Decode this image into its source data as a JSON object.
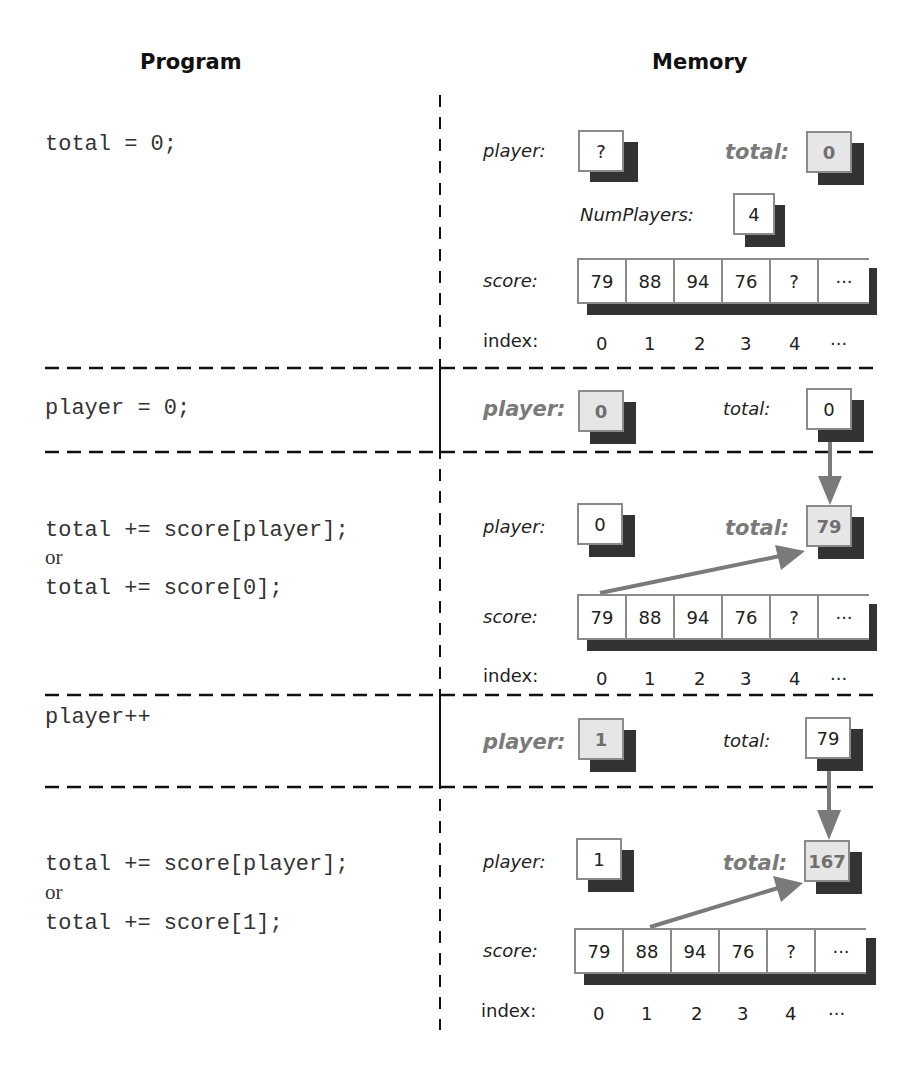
{
  "headers": {
    "program": "Program",
    "memory": "Memory"
  },
  "colors": {
    "arrow": "#7a7a7a",
    "highlight_fill": "#e6e6e6",
    "shadow": "#333333",
    "box_border": "#8a8a8a"
  },
  "steps": [
    {
      "code": [
        "total = 0;"
      ],
      "memory": {
        "player": {
          "label": "player:",
          "value": "?",
          "highlighted": false
        },
        "total": {
          "label": "total:",
          "value": "0",
          "highlighted": true
        },
        "numplayers": {
          "label": "NumPlayers:",
          "value": "4"
        },
        "score": {
          "label": "score:",
          "cells": [
            "79",
            "88",
            "94",
            "76",
            "?",
            "..."
          ]
        },
        "index": {
          "label": "index:",
          "values": [
            "0",
            "1",
            "2",
            "3",
            "4",
            "..."
          ]
        }
      }
    },
    {
      "code": [
        "player = 0;"
      ],
      "memory": {
        "player": {
          "label": "player:",
          "value": "0",
          "highlighted": true
        },
        "total": {
          "label": "total:",
          "value": "0",
          "highlighted": false
        }
      }
    },
    {
      "code": [
        "total += score[player];",
        "or",
        "total += score[0];"
      ],
      "memory": {
        "player": {
          "label": "player:",
          "value": "0",
          "highlighted": false
        },
        "total": {
          "label": "total:",
          "value": "79",
          "highlighted": true
        },
        "score": {
          "label": "score:",
          "cells": [
            "79",
            "88",
            "94",
            "76",
            "?",
            "..."
          ]
        },
        "index": {
          "label": "index:",
          "values": [
            "0",
            "1",
            "2",
            "3",
            "4",
            "..."
          ]
        }
      }
    },
    {
      "code": [
        "player++"
      ],
      "memory": {
        "player": {
          "label": "player:",
          "value": "1",
          "highlighted": true
        },
        "total": {
          "label": "total:",
          "value": "79",
          "highlighted": false
        }
      }
    },
    {
      "code": [
        "total += score[player];",
        "or",
        "total += score[1];"
      ],
      "memory": {
        "player": {
          "label": "player:",
          "value": "1",
          "highlighted": false
        },
        "total": {
          "label": "total:",
          "value": "167",
          "highlighted": true
        },
        "score": {
          "label": "score:",
          "cells": [
            "79",
            "88",
            "94",
            "76",
            "?",
            "..."
          ]
        },
        "index": {
          "label": "index:",
          "values": [
            "0",
            "1",
            "2",
            "3",
            "4",
            "..."
          ]
        }
      }
    }
  ]
}
